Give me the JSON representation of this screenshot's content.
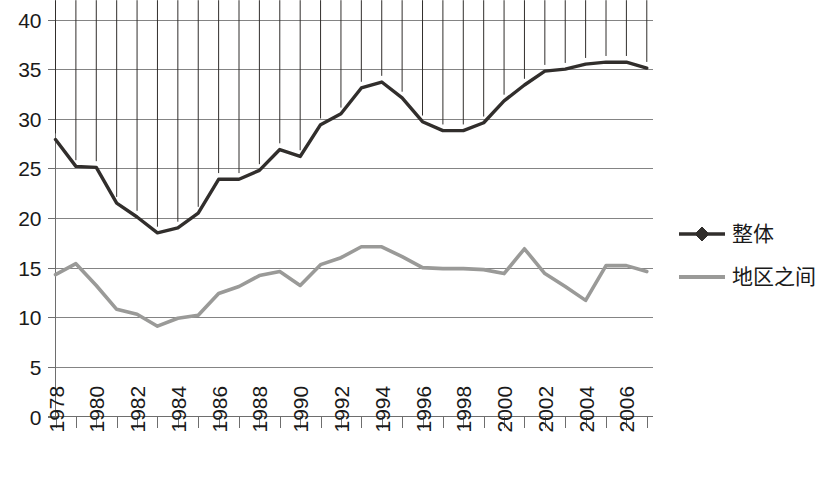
{
  "chart_data": {
    "type": "line",
    "title": "",
    "xlabel": "",
    "ylabel": "",
    "ylim": [
      0,
      40
    ],
    "ytick_step": 5,
    "ytick_labels": [
      "0",
      "5",
      "10",
      "15",
      "20",
      "25",
      "30",
      "35",
      "40"
    ],
    "grid": true,
    "legend_position": "right",
    "x": [
      1978,
      1979,
      1980,
      1981,
      1982,
      1983,
      1984,
      1985,
      1986,
      1987,
      1988,
      1989,
      1990,
      1991,
      1992,
      1993,
      1994,
      1995,
      1996,
      1997,
      1998,
      1999,
      2000,
      2001,
      2002,
      2003,
      2004,
      2005,
      2006,
      2007
    ],
    "xtick_labels": [
      "1978",
      "1980",
      "1982",
      "1984",
      "1986",
      "1988",
      "1990",
      "1992",
      "1994",
      "1996",
      "1998",
      "2000",
      "2002",
      "2004",
      "2006"
    ],
    "xtick_label_years": [
      1978,
      1980,
      1982,
      1984,
      1986,
      1988,
      1990,
      1992,
      1994,
      1996,
      1998,
      2000,
      2002,
      2004,
      2006
    ],
    "series": [
      {
        "name": "整体",
        "color": "#312e2c",
        "marker": "diamond",
        "values": [
          27.9,
          25.2,
          25.1,
          21.5,
          20.1,
          18.5,
          19.0,
          20.5,
          23.9,
          23.9,
          24.8,
          26.9,
          26.2,
          29.4,
          30.5,
          33.1,
          33.7,
          32.1,
          29.7,
          28.8,
          28.8,
          29.6,
          31.8,
          33.4,
          34.8,
          35.0,
          35.5,
          35.7,
          35.7,
          35.1
        ]
      },
      {
        "name": "地区之间",
        "color": "#9a9a98",
        "marker": "none",
        "values": [
          14.3,
          15.4,
          13.2,
          10.8,
          10.3,
          9.1,
          9.9,
          10.2,
          12.4,
          13.1,
          14.2,
          14.6,
          13.2,
          15.3,
          16.0,
          17.1,
          17.1,
          16.1,
          15.0,
          14.9,
          14.9,
          14.8,
          14.4,
          16.9,
          14.4,
          13.1,
          11.7,
          15.2,
          15.2,
          14.6
        ]
      }
    ]
  },
  "legend": {
    "items": [
      {
        "label": "整体",
        "color": "#312e2c",
        "marker": "diamond"
      },
      {
        "label": "地区之间",
        "color": "#9a9a98",
        "marker": "none"
      }
    ]
  }
}
